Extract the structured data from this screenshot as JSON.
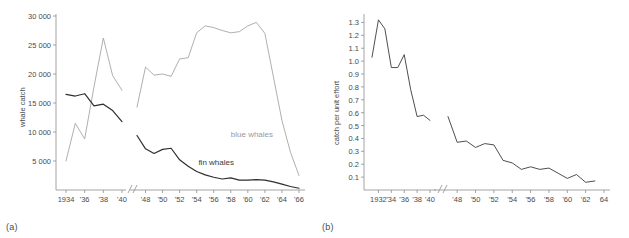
{
  "figure": {
    "panels": [
      {
        "key": "a",
        "label": "(a)",
        "ylabel": "whale catch",
        "y_ticks": [
          "30 000",
          "25 000",
          "20 000",
          "15 000",
          "10 000",
          "5 000"
        ],
        "x_ticks": [
          "1934",
          "'36",
          "'38",
          "'40",
          "'48",
          "'50",
          "'52",
          "'54",
          "'56",
          "'58",
          "'60",
          "'62",
          "'64",
          "'66"
        ],
        "series_labels": {
          "blue": "blue whales",
          "fin": "fin whales"
        },
        "colors": {
          "blue": "#a6a6a6",
          "fin": "#2e2e2e",
          "axis": "#8d8d8d"
        }
      },
      {
        "key": "b",
        "label": "(b)",
        "ylabel": "catch per unit effort",
        "y_ticks": [
          "1.3",
          "1.2",
          "1.1",
          "1.0",
          "0.9",
          "0.8",
          "0.7",
          "0.6",
          "0.5",
          "0.4",
          "0.3",
          "0.2",
          "0.1"
        ],
        "x_ticks": [
          "1932",
          "'34",
          "'36",
          "'38",
          "'40",
          "'48",
          "'50",
          "'52",
          "'54",
          "'56",
          "'58",
          "'60",
          "'62",
          "64"
        ],
        "colors": {
          "line": "#3a3a3a",
          "axis": "#8d8d8d"
        }
      }
    ]
  },
  "chart_data": [
    {
      "type": "line",
      "panel": "(a)",
      "title": "",
      "xlabel": "",
      "ylabel": "whale catch",
      "ylim": [
        0,
        30000
      ],
      "y_ticks": [
        5000,
        10000,
        15000,
        20000,
        25000,
        30000
      ],
      "x_ticks": [
        1934,
        1936,
        1938,
        1940,
        1948,
        1950,
        1952,
        1954,
        1956,
        1958,
        1960,
        1962,
        1964,
        1966
      ],
      "axis_break": {
        "between": [
          1940,
          1948
        ],
        "marker": "//"
      },
      "grid": false,
      "legend": "inline-annotation",
      "series": [
        {
          "name": "blue whales",
          "color": "#a6a6a6",
          "segments": [
            {
              "x": [
                1934,
                1935,
                1936,
                1937,
                1938,
                1939,
                1940
              ],
              "y": [
                5000,
                11500,
                8800,
                17800,
                26200,
                19700,
                17200
              ]
            },
            {
              "x": [
                1947,
                1948,
                1949,
                1950,
                1951,
                1952,
                1953,
                1954,
                1955,
                1956,
                1957,
                1958,
                1959,
                1960,
                1961,
                1962,
                1963,
                1964,
                1965,
                1966
              ],
              "y": [
                14300,
                21200,
                19800,
                20000,
                19600,
                22600,
                22800,
                27100,
                28300,
                28000,
                27500,
                27100,
                27300,
                28300,
                28900,
                27000,
                19500,
                12000,
                6500,
                2500
              ]
            }
          ]
        },
        {
          "name": "fin whales",
          "color": "#2e2e2e",
          "segments": [
            {
              "x": [
                1934,
                1935,
                1936,
                1937,
                1938,
                1939,
                1940
              ],
              "y": [
                16500,
                16200,
                16600,
                14500,
                14800,
                13700,
                11800
              ]
            },
            {
              "x": [
                1947,
                1948,
                1949,
                1950,
                1951,
                1952,
                1953,
                1954,
                1955,
                1956,
                1957,
                1958,
                1959,
                1960,
                1961,
                1962,
                1963,
                1964,
                1965,
                1966
              ],
              "y": [
                9400,
                7100,
                6300,
                7000,
                7200,
                5200,
                4100,
                3200,
                2600,
                2200,
                1900,
                2100,
                1700,
                1700,
                1800,
                1700,
                1400,
                1000,
                600,
                300
              ]
            }
          ]
        }
      ]
    },
    {
      "type": "line",
      "panel": "(b)",
      "title": "",
      "xlabel": "",
      "ylabel": "catch per unit effort",
      "ylim": [
        0,
        1.35
      ],
      "y_ticks": [
        0.1,
        0.2,
        0.3,
        0.4,
        0.5,
        0.6,
        0.7,
        0.8,
        0.9,
        1.0,
        1.1,
        1.2,
        1.3
      ],
      "x_ticks": [
        1932,
        1934,
        1936,
        1938,
        1940,
        1948,
        1950,
        1952,
        1954,
        1956,
        1958,
        1960,
        1962,
        1964
      ],
      "axis_break": {
        "between": [
          1940,
          1948
        ],
        "marker": "//"
      },
      "grid": false,
      "legend": "none",
      "series": [
        {
          "name": "catch per unit effort",
          "color": "#3a3a3a",
          "segments": [
            {
              "x": [
                1931,
                1932,
                1933,
                1934,
                1935,
                1936,
                1937,
                1938,
                1939,
                1940
              ],
              "y": [
                1.03,
                1.32,
                1.25,
                0.95,
                0.95,
                1.05,
                0.78,
                0.57,
                0.58,
                0.54
              ]
            },
            {
              "x": [
                1947,
                1948,
                1949,
                1950,
                1951,
                1952,
                1953,
                1954,
                1955,
                1956,
                1957,
                1958,
                1959,
                1960,
                1961,
                1962,
                1963
              ],
              "y": [
                0.57,
                0.37,
                0.38,
                0.33,
                0.36,
                0.35,
                0.23,
                0.21,
                0.16,
                0.18,
                0.16,
                0.17,
                0.13,
                0.09,
                0.12,
                0.06,
                0.07
              ]
            }
          ]
        }
      ]
    }
  ]
}
